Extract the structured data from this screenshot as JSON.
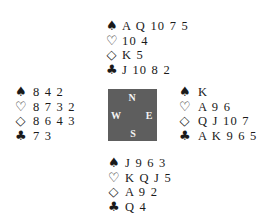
{
  "suit_icons": {
    "spades": "♠",
    "hearts": "♡",
    "diamonds": "◇",
    "clubs": "♣"
  },
  "compass": {
    "north": "N",
    "west": "W",
    "east": "E",
    "south": "S",
    "background_color": "#5e5e5e"
  },
  "hands": {
    "north": {
      "spades": "A Q 10 7 5",
      "hearts": "10 4",
      "diamonds": "K 5",
      "clubs": "J 10 8 2"
    },
    "west": {
      "spades": "8 4 2",
      "hearts": "8 7 3 2",
      "diamonds": "8 6 4 3",
      "clubs": "7 3"
    },
    "east": {
      "spades": "K",
      "hearts": "A 9 6",
      "diamonds": "Q J 10 7",
      "clubs": "A K 9 6 5"
    },
    "south": {
      "spades": "J 9 6 3",
      "hearts": "K Q J 5",
      "diamonds": "A 9 2",
      "clubs": "Q 4"
    }
  }
}
